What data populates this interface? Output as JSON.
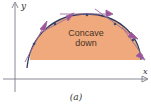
{
  "figure": {
    "caption": "(a)",
    "region_label_line1": "Concave",
    "region_label_line2": "down",
    "axis_x_label": "x",
    "axis_y_label": "y"
  },
  "colors": {
    "region_fill": "#efa97c",
    "curve": "#2e3a5c",
    "tangent": "#9a6c9a",
    "arrowhead": "#a0509c",
    "axis": "#7a7a8a",
    "point": "#3a4a7a"
  },
  "tangent_points": [
    {
      "x": 34,
      "y": 44
    },
    {
      "x": 55,
      "y": 24
    },
    {
      "x": 87,
      "y": 15
    },
    {
      "x": 115,
      "y": 24
    },
    {
      "x": 133,
      "y": 40
    }
  ]
}
